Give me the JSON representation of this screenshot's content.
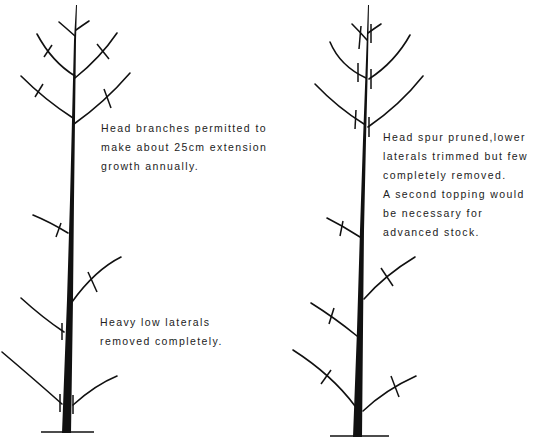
{
  "figure": {
    "left_tree": {
      "label": "Tree before pruning – head branches extension",
      "captions": {
        "top": [
          "Head branches permitted to",
          "make about 25cm extension",
          "growth annually."
        ],
        "bottom": [
          "Heavy low laterals",
          "removed completely."
        ]
      }
    },
    "right_tree": {
      "label": "Head spur pruned tree",
      "captions": {
        "top": [
          "Head spur pruned,lower",
          "laterals trimmed but few",
          "completely removed.",
          "A second topping would",
          "be necessary for",
          "advanced stock."
        ]
      }
    },
    "colors": {
      "ink": "#111111",
      "text": "#222222",
      "background": "#ffffff"
    }
  }
}
